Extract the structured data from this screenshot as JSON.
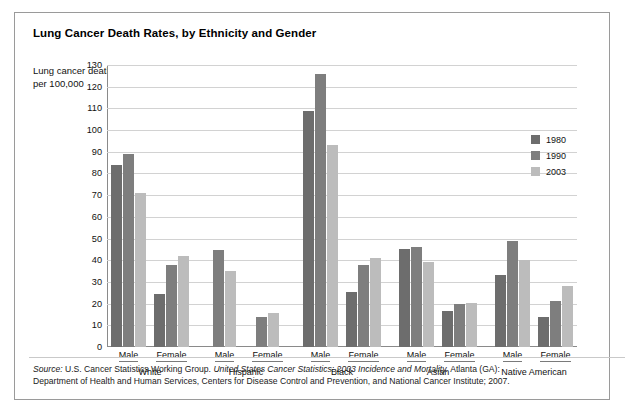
{
  "title": "Lung Cancer Death Rates, by Ethnicity and Gender",
  "axis_caption": "Lung cancer deaths per 100,000",
  "legend": {
    "items": [
      {
        "label": "1980",
        "color": "#6d6d6d",
        "key": "y1980"
      },
      {
        "label": "1990",
        "color": "#7e7e7e",
        "key": "y1990"
      },
      {
        "label": "2003",
        "color": "#bcbcbc",
        "key": "y2003"
      }
    ]
  },
  "source": {
    "label": "Source:",
    "line1_a": " U.S. Cancer Statistics Working Group. ",
    "line1_italic": "United States Cancer Statistics: 2003 Incidence and Mortality.",
    "line1_b": " Atlanta (GA):",
    "line2": "Department of Health and Human Services, Centers for Disease Control and Prevention, and National Cancer Institute; 2007."
  },
  "chart_data": {
    "type": "bar",
    "title": "Lung Cancer Death Rates, by Ethnicity and Gender",
    "xlabel": "",
    "ylabel": "Lung cancer deaths per 100,000",
    "ylim": [
      0,
      130
    ],
    "ytick_step": 10,
    "yticks": [
      "0",
      "10",
      "20",
      "30",
      "40",
      "50",
      "60",
      "70",
      "80",
      "90",
      "100",
      "110",
      "120",
      "130"
    ],
    "grid": true,
    "legend_position": "right-inside",
    "series": [
      {
        "name": "1980",
        "color": "#6d6d6d"
      },
      {
        "name": "1990",
        "color": "#7e7e7e"
      },
      {
        "name": "2003",
        "color": "#bcbcbc"
      }
    ],
    "groups": [
      {
        "ethnicity": "White",
        "genders": [
          {
            "gender": "Male",
            "values": {
              "1980": 84,
              "1990": 89,
              "2003": 71
            }
          },
          {
            "gender": "Female",
            "values": {
              "1980": 24.5,
              "1990": 38,
              "2003": 42
            }
          }
        ]
      },
      {
        "ethnicity": "Hispanic",
        "genders": [
          {
            "gender": "Male",
            "values": {
              "1980": null,
              "1990": 44.5,
              "2003": 35
            }
          },
          {
            "gender": "Female",
            "values": {
              "1980": null,
              "1990": 14,
              "2003": 15.5
            }
          }
        ]
      },
      {
        "ethnicity": "Black",
        "genders": [
          {
            "gender": "Male",
            "values": {
              "1980": 109,
              "1990": 126,
              "2003": 93
            }
          },
          {
            "gender": "Female",
            "values": {
              "1980": 25.5,
              "1990": 38,
              "2003": 41
            }
          }
        ]
      },
      {
        "ethnicity": "Asian",
        "genders": [
          {
            "gender": "Male",
            "values": {
              "1980": 45,
              "1990": 46,
              "2003": 39
            }
          },
          {
            "gender": "Female",
            "values": {
              "1980": 16.5,
              "1990": 20,
              "2003": 20.5
            }
          }
        ]
      },
      {
        "ethnicity": "Native American",
        "genders": [
          {
            "gender": "Male",
            "values": {
              "1980": 33,
              "1990": 49,
              "2003": 40
            }
          },
          {
            "gender": "Female",
            "values": {
              "1980": 14,
              "1990": 21,
              "2003": 28
            }
          }
        ]
      }
    ]
  }
}
